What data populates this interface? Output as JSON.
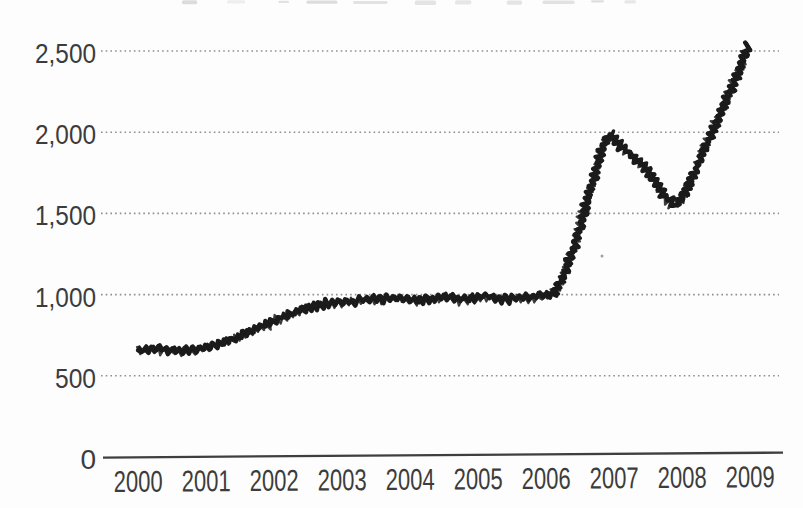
{
  "artifacts": {
    "top_edge_note": "faint illegible remnants of a cropped-off chart title along the very top edge",
    "speck_note": "tiny scan speck inside the plot area"
  },
  "chart_data": {
    "type": "line",
    "title": "",
    "title_note": "title cropped out of frame; only faint marks visible at top edge",
    "xlabel": "",
    "ylabel": "",
    "categories": [
      2000,
      2001,
      2002,
      2003,
      2004,
      2005,
      2006,
      2007,
      2008,
      2009
    ],
    "values": [
      650,
      690,
      850,
      965,
      975,
      985,
      1000,
      1990,
      1550,
      2510
    ],
    "x_tick_labels": [
      "2000",
      "2001",
      "2002",
      "2003",
      "2004",
      "2005",
      "2006",
      "2007",
      "2008",
      "2009"
    ],
    "y_tick_values": [
      0,
      500,
      1000,
      1500,
      2000,
      2500
    ],
    "y_tick_labels": [
      "0",
      "500",
      "1,000",
      "1,500",
      "2,000",
      "2,500"
    ],
    "xlim": [
      2000,
      2009
    ],
    "ylim": [
      0,
      2500
    ],
    "grid": "horizontal dotted gridlines at each y tick, solid baseline at 0, no vertical axis line",
    "legend": "none",
    "line_style": "thick hand-drawn black marker scribble (zigzag hatched stroke)",
    "detail_points": [
      [
        2000.0,
        655
      ],
      [
        2000.3,
        665
      ],
      [
        2000.6,
        650
      ],
      [
        2000.9,
        668
      ],
      [
        2001.15,
        688
      ],
      [
        2001.5,
        745
      ],
      [
        2001.8,
        800
      ],
      [
        2002.1,
        855
      ],
      [
        2002.45,
        915
      ],
      [
        2002.8,
        945
      ],
      [
        2003.1,
        955
      ],
      [
        2003.45,
        970
      ],
      [
        2003.8,
        978
      ],
      [
        2004.1,
        962
      ],
      [
        2004.45,
        982
      ],
      [
        2004.8,
        970
      ],
      [
        2005.1,
        988
      ],
      [
        2005.45,
        972
      ],
      [
        2005.75,
        985
      ],
      [
        2006.0,
        990
      ],
      [
        2006.12,
        1005
      ],
      [
        2006.3,
        1150
      ],
      [
        2006.5,
        1420
      ],
      [
        2006.68,
        1680
      ],
      [
        2006.82,
        1900
      ],
      [
        2006.93,
        1985
      ],
      [
        2007.1,
        1910
      ],
      [
        2007.3,
        1845
      ],
      [
        2007.55,
        1735
      ],
      [
        2007.75,
        1595
      ],
      [
        2007.9,
        1548
      ],
      [
        2008.05,
        1620
      ],
      [
        2008.25,
        1810
      ],
      [
        2008.5,
        2060
      ],
      [
        2008.72,
        2260
      ],
      [
        2008.97,
        2530
      ]
    ],
    "colors": {
      "line": "#1b1b1b",
      "grid": "#8f8f8f",
      "axis": "#3f3f3f",
      "tick_text": "#3c3c3c",
      "background": "#fdfdfd"
    }
  }
}
